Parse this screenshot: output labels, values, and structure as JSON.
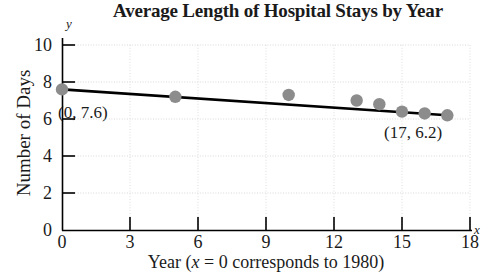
{
  "chart_data": {
    "type": "scatter",
    "title": "Average Length of Hospital Stays by Year",
    "xlabel": "Year (x = 0 corresponds to 1980)",
    "ylabel": "Number of Days",
    "xlim": [
      0,
      18
    ],
    "ylim": [
      0,
      10
    ],
    "xticks": [
      0,
      3,
      6,
      9,
      12,
      15,
      18
    ],
    "yticks": [
      0,
      2,
      4,
      6,
      8,
      10
    ],
    "xtick_labels": [
      "0",
      "3",
      "6",
      "9",
      "12",
      "15",
      "18"
    ],
    "ytick_labels": [
      "0",
      "2",
      "4",
      "6",
      "8",
      "10"
    ],
    "grid": true,
    "legend": "none",
    "x_axis_letter": "x",
    "y_axis_letter": "y",
    "point_color": "#8c8c8c",
    "line_color": "#000000",
    "x": [
      0,
      5,
      10,
      13,
      14,
      15,
      16,
      17
    ],
    "values": [
      7.6,
      7.2,
      7.3,
      7.0,
      6.8,
      6.4,
      6.3,
      6.2
    ],
    "series": [
      {
        "name": "Average length of stay",
        "type": "scatter",
        "x": [
          0,
          5,
          10,
          13,
          14,
          15,
          16,
          17
        ],
        "values": [
          7.6,
          7.2,
          7.3,
          7.0,
          6.8,
          6.4,
          6.3,
          6.2
        ]
      },
      {
        "name": "Linear regression line",
        "type": "line",
        "x": [
          0,
          17
        ],
        "values": [
          7.6,
          6.2
        ]
      }
    ],
    "annotations": [
      {
        "label": "(0, 7.6)",
        "x": 0,
        "y": 7.6
      },
      {
        "label": "(17, 6.2)",
        "x": 17,
        "y": 6.2
      }
    ]
  },
  "xlabel_parts": {
    "before": "Year (",
    "italic": "x",
    "after": " = 0 corresponds to 1980)"
  }
}
